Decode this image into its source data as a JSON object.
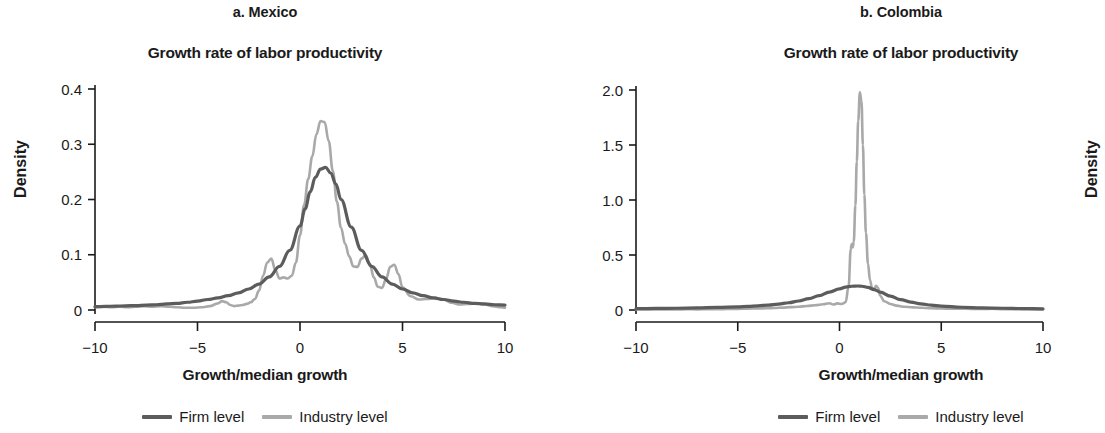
{
  "figure": {
    "panels": [
      {
        "id": "a",
        "title": "a. Mexico",
        "subtitle": "Growth rate of labor productivity",
        "xlabel": "Growth/median growth",
        "ylabel": "Density",
        "legend": [
          {
            "label": "Firm level",
            "color": "#5c5c5c"
          },
          {
            "label": "Industry level",
            "color": "#a9a9a9"
          }
        ]
      },
      {
        "id": "b",
        "title": "b. Colombia",
        "subtitle": "Growth rate of labor productivity",
        "xlabel": "Growth/median growth",
        "ylabel": "Density",
        "legend": [
          {
            "label": "Firm level",
            "color": "#5c5c5c"
          },
          {
            "label": "Industry level",
            "color": "#a9a9a9"
          }
        ]
      }
    ]
  },
  "chart_data": [
    {
      "type": "line",
      "panel": "a. Mexico",
      "title": "Growth rate of labor productivity",
      "xlabel": "Growth/median growth",
      "ylabel": "Density",
      "xlim": [
        -10,
        10
      ],
      "ylim": [
        0,
        0.4
      ],
      "xticks": [
        -10,
        -5,
        0,
        5,
        10
      ],
      "xticklabels": [
        "−10",
        "−5",
        "0",
        "5",
        "10"
      ],
      "yticks": [
        0,
        0.1,
        0.2,
        0.3,
        0.4
      ],
      "yticklabels": [
        "0",
        "0.1",
        "0.2",
        "0.3",
        "0.4"
      ],
      "grid": false,
      "legend_position": "below",
      "series": [
        {
          "name": "Firm level",
          "color": "#5c5c5c",
          "x": [
            -10,
            -9.5,
            -9,
            -8.5,
            -8,
            -7.5,
            -7,
            -6.5,
            -6,
            -5.5,
            -5,
            -4.5,
            -4,
            -3.5,
            -3,
            -2.5,
            -2,
            -1.5,
            -1,
            -0.5,
            0,
            0.25,
            0.5,
            0.75,
            1,
            1.25,
            1.5,
            1.75,
            2,
            2.5,
            3,
            3.5,
            4,
            4.5,
            5,
            5.5,
            6,
            6.5,
            7,
            7.5,
            8,
            8.5,
            9,
            9.5,
            10
          ],
          "y": [
            0.006,
            0.0065,
            0.007,
            0.0075,
            0.008,
            0.009,
            0.0095,
            0.011,
            0.012,
            0.014,
            0.016,
            0.019,
            0.022,
            0.026,
            0.031,
            0.038,
            0.047,
            0.06,
            0.079,
            0.108,
            0.152,
            0.183,
            0.214,
            0.24,
            0.255,
            0.258,
            0.248,
            0.228,
            0.2,
            0.15,
            0.108,
            0.079,
            0.06,
            0.047,
            0.038,
            0.031,
            0.026,
            0.022,
            0.019,
            0.016,
            0.014,
            0.012,
            0.011,
            0.0095,
            0.009
          ]
        },
        {
          "name": "Industry level",
          "color": "#a9a9a9",
          "x": [
            -10,
            -9.6,
            -9.2,
            -8.8,
            -8.4,
            -8,
            -7.6,
            -7.2,
            -6.8,
            -6.4,
            -6,
            -5.6,
            -5.2,
            -4.8,
            -4.4,
            -4,
            -3.8,
            -3.6,
            -3.4,
            -3.2,
            -3,
            -2.8,
            -2.6,
            -2.4,
            -2.2,
            -2,
            -1.8,
            -1.6,
            -1.4,
            -1.2,
            -1,
            -0.8,
            -0.6,
            -0.4,
            -0.2,
            0,
            0.2,
            0.4,
            0.6,
            0.8,
            1,
            1.2,
            1.4,
            1.6,
            1.8,
            2,
            2.2,
            2.4,
            2.6,
            2.8,
            3,
            3.2,
            3.4,
            3.6,
            3.8,
            4,
            4.2,
            4.4,
            4.6,
            4.8,
            5,
            5.4,
            5.8,
            6.2,
            6.6,
            7,
            7.4,
            7.8,
            8.2,
            8.6,
            9,
            9.4,
            9.8,
            10
          ],
          "y": [
            0.005,
            0.006,
            0.005,
            0.006,
            0.005,
            0.006,
            0.007,
            0.006,
            0.007,
            0.006,
            0.005,
            0.004,
            0.004,
            0.005,
            0.007,
            0.012,
            0.016,
            0.014,
            0.009,
            0.007,
            0.008,
            0.009,
            0.011,
            0.014,
            0.02,
            0.035,
            0.062,
            0.086,
            0.093,
            0.072,
            0.057,
            0.059,
            0.057,
            0.062,
            0.086,
            0.135,
            0.19,
            0.237,
            0.278,
            0.318,
            0.342,
            0.34,
            0.306,
            0.252,
            0.196,
            0.149,
            0.12,
            0.097,
            0.079,
            0.078,
            0.093,
            0.099,
            0.084,
            0.059,
            0.042,
            0.04,
            0.056,
            0.078,
            0.082,
            0.065,
            0.041,
            0.025,
            0.019,
            0.02,
            0.022,
            0.019,
            0.013,
            0.01,
            0.011,
            0.012,
            0.01,
            0.007,
            0.005,
            0.004
          ]
        }
      ]
    },
    {
      "type": "line",
      "panel": "b. Colombia",
      "title": "Growth rate of labor productivity",
      "xlabel": "Growth/median growth",
      "ylabel": "Density",
      "xlim": [
        -10,
        10
      ],
      "ylim": [
        0,
        2.0
      ],
      "xticks": [
        -10,
        -5,
        0,
        5,
        10
      ],
      "xticklabels": [
        "−10",
        "−5",
        "0",
        "5",
        "10"
      ],
      "yticks": [
        0,
        0.5,
        1.0,
        1.5,
        2.0
      ],
      "yticklabels": [
        "0",
        "0.5",
        "1.0",
        "1.5",
        "2.0"
      ],
      "grid": false,
      "legend_position": "below",
      "series": [
        {
          "name": "Firm level",
          "color": "#5c5c5c",
          "x": [
            -10,
            -9,
            -8,
            -7,
            -6,
            -5,
            -4.5,
            -4,
            -3.5,
            -3,
            -2.5,
            -2,
            -1.5,
            -1,
            -0.5,
            0,
            0.3,
            0.6,
            0.9,
            1.1,
            1.4,
            1.7,
            2,
            2.5,
            3,
            3.5,
            4,
            4.5,
            5,
            6,
            7,
            8,
            9,
            10
          ],
          "y": [
            0.012,
            0.014,
            0.016,
            0.019,
            0.023,
            0.029,
            0.033,
            0.038,
            0.045,
            0.054,
            0.066,
            0.082,
            0.103,
            0.13,
            0.163,
            0.192,
            0.208,
            0.216,
            0.218,
            0.216,
            0.205,
            0.186,
            0.163,
            0.126,
            0.095,
            0.072,
            0.056,
            0.044,
            0.036,
            0.025,
            0.019,
            0.016,
            0.013,
            0.011
          ]
        },
        {
          "name": "Industry level",
          "color": "#a9a9a9",
          "x": [
            -10,
            -9.5,
            -9,
            -8.5,
            -8,
            -7.5,
            -7,
            -6.5,
            -6,
            -5.5,
            -5,
            -4.5,
            -4,
            -3.6,
            -3.2,
            -2.8,
            -2.4,
            -2,
            -1.6,
            -1.2,
            -0.8,
            -0.5,
            -0.3,
            -0.1,
            0.1,
            0.3,
            0.45,
            0.55,
            0.6,
            0.65,
            0.7,
            0.78,
            0.85,
            0.92,
            1.0,
            1.08,
            1.15,
            1.22,
            1.3,
            1.4,
            1.5,
            1.6,
            1.7,
            1.8,
            1.9,
            2.0,
            2.2,
            2.5,
            2.8,
            3.2,
            3.6,
            4,
            4.5,
            5,
            5.5,
            6,
            6.5,
            7,
            7.5,
            8,
            8.5,
            9,
            9.5,
            10
          ],
          "y": [
            0.004,
            0.005,
            0.004,
            0.006,
            0.005,
            0.007,
            0.006,
            0.008,
            0.007,
            0.009,
            0.01,
            0.012,
            0.014,
            0.016,
            0.018,
            0.022,
            0.026,
            0.03,
            0.036,
            0.043,
            0.052,
            0.062,
            0.05,
            0.06,
            0.055,
            0.07,
            0.22,
            0.55,
            0.6,
            0.57,
            0.62,
            0.95,
            1.35,
            1.72,
            1.98,
            1.9,
            1.5,
            1.05,
            0.7,
            0.42,
            0.27,
            0.2,
            0.19,
            0.22,
            0.2,
            0.13,
            0.08,
            0.055,
            0.04,
            0.03,
            0.024,
            0.02,
            0.016,
            0.013,
            0.011,
            0.012,
            0.01,
            0.009,
            0.011,
            0.008,
            0.007,
            0.008,
            0.006,
            0.005
          ]
        }
      ]
    }
  ]
}
